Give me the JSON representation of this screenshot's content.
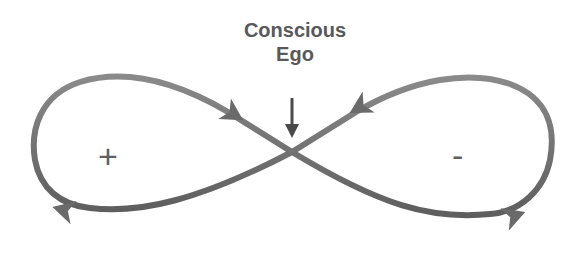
{
  "diagram": {
    "title_line1": "Conscious",
    "title_line2": "Ego",
    "left_loop_sign": "+",
    "right_loop_sign": "-",
    "colors": {
      "stroke": "#6e6e6e",
      "arrowhead": "#6a6a6a",
      "text": "#595959",
      "background": "#ffffff"
    }
  }
}
